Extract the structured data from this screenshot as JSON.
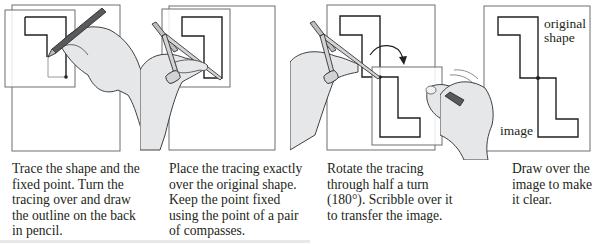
{
  "figure": {
    "steps": [
      {
        "id": "trace",
        "caption": "Trace the shape and the fixed point. Turn the tracing over and draw the outline on the back in pencil.",
        "caption_lines": [
          "Trace the shape and the",
          "fixed point. Turn the",
          "tracing over and draw",
          "the outline on the back",
          "in pencil."
        ]
      },
      {
        "id": "place",
        "caption": "Place the tracing exactly over the original shape. Keep the point fixed using the point of a pair of compasses.",
        "caption_lines": [
          "Place the tracing exactly",
          "over the original shape.",
          "Keep the point fixed",
          "using the point of a pair",
          "of compasses."
        ]
      },
      {
        "id": "rotate",
        "caption": "Rotate the tracing through half a turn (180°). Scribble over it to transfer the image.",
        "caption_lines": [
          "Rotate the tracing",
          "through half a turn",
          "(180°). Scribble over it",
          "to transfer the image."
        ]
      },
      {
        "id": "draw",
        "caption": "Draw over the image to make it clear.",
        "caption_lines": [
          "Draw over the",
          "image to make",
          "it clear."
        ],
        "labels": {
          "original": [
            "original",
            "shape"
          ],
          "image": "image"
        }
      }
    ],
    "rotation": "180°",
    "colors": {
      "line": "#231f20",
      "paper": "#ffffff",
      "paper_edge": "#6d6e71",
      "hand": "#e6e7e8",
      "hand_edge": "#414042"
    }
  }
}
